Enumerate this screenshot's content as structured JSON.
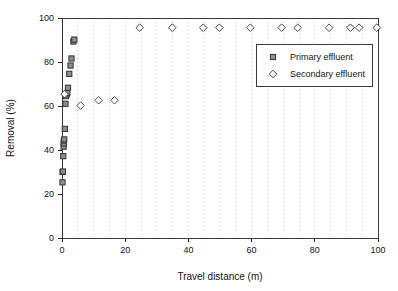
{
  "chart_data": {
    "type": "scatter",
    "title": "",
    "xlabel": "Travel distance (m)",
    "ylabel": "Removal (%)",
    "xlim": [
      0,
      100
    ],
    "ylim": [
      0,
      100
    ],
    "xticks": [
      0,
      20,
      40,
      60,
      80,
      100
    ],
    "yticks": [
      0,
      20,
      40,
      60,
      80,
      100
    ],
    "xtick_labels": [
      "0",
      "20",
      "40",
      "60",
      "80",
      "100"
    ],
    "ytick_labels": [
      "0",
      "20",
      "40",
      "60",
      "80",
      "100"
    ],
    "grid": "vertical dotted minor gridlines every 5 m",
    "legend_position": "upper right inside plot area",
    "series": [
      {
        "name": "Primary effluent",
        "marker": "square",
        "marker_fill": "#8e8e8e",
        "marker_edge": "#333333",
        "points": [
          {
            "x": 0.15,
            "y": 25.3
          },
          {
            "x": 0.2,
            "y": 30.0
          },
          {
            "x": 0.3,
            "y": 30.2
          },
          {
            "x": 0.4,
            "y": 37.2
          },
          {
            "x": 0.5,
            "y": 41.5
          },
          {
            "x": 0.55,
            "y": 43.0
          },
          {
            "x": 0.6,
            "y": 44.3
          },
          {
            "x": 0.7,
            "y": 44.8
          },
          {
            "x": 0.9,
            "y": 49.6
          },
          {
            "x": 1.1,
            "y": 61.0
          },
          {
            "x": 1.3,
            "y": 64.5
          },
          {
            "x": 1.5,
            "y": 65.3
          },
          {
            "x": 1.7,
            "y": 66.0
          },
          {
            "x": 1.9,
            "y": 68.3
          },
          {
            "x": 2.3,
            "y": 74.6
          },
          {
            "x": 2.7,
            "y": 78.4
          },
          {
            "x": 3.0,
            "y": 81.6
          },
          {
            "x": 3.6,
            "y": 89.3
          },
          {
            "x": 3.9,
            "y": 90.2
          }
        ]
      },
      {
        "name": "Secondary effluent",
        "marker": "diamond",
        "marker_fill": "#ffffff",
        "marker_edge": "#4a4a4a",
        "points": [
          {
            "x": 0.8,
            "y": 65.4
          },
          {
            "x": 5.9,
            "y": 60.2
          },
          {
            "x": 11.6,
            "y": 62.6
          },
          {
            "x": 16.6,
            "y": 62.6
          },
          {
            "x": 24.6,
            "y": 95.6
          },
          {
            "x": 34.9,
            "y": 95.6
          },
          {
            "x": 44.7,
            "y": 95.6
          },
          {
            "x": 49.8,
            "y": 95.6
          },
          {
            "x": 59.6,
            "y": 95.6
          },
          {
            "x": 69.5,
            "y": 95.6
          },
          {
            "x": 74.6,
            "y": 95.6
          },
          {
            "x": 84.5,
            "y": 95.6
          },
          {
            "x": 91.3,
            "y": 95.6
          },
          {
            "x": 94.0,
            "y": 95.6
          },
          {
            "x": 99.6,
            "y": 95.6
          }
        ]
      }
    ]
  },
  "legend": {
    "entries": [
      {
        "label": "Primary effluent",
        "marker": "square"
      },
      {
        "label": "Secondary effluent",
        "marker": "diamond"
      }
    ]
  }
}
